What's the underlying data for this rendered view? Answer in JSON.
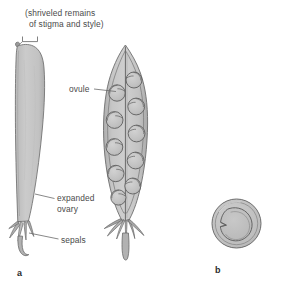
{
  "figure": {
    "background_color": "#ffffff",
    "ink_color": "#5a5a5a",
    "fill_light": "#c9c9c9",
    "fill_mid": "#b4b4b4",
    "fill_dark": "#a0a0a0",
    "label_color": "#4a4a4a"
  },
  "labels": {
    "stigma_style": "(shriveled remains\nof stigma and style)",
    "stigma_style_line1": "(shriveled remains",
    "stigma_style_line2": "of stigma and style)",
    "ovule": "ovule",
    "expanded_ovary_line1": "expanded",
    "expanded_ovary_line2": "ovary",
    "sepals": "sepals"
  },
  "captions": {
    "a": "a",
    "b": "b"
  },
  "parts": {
    "intact_pod": {
      "name": "intact pod",
      "caption": "a",
      "has_stigma_remnant": true,
      "has_sepals": true,
      "has_stalk": true
    },
    "sectioned_pod": {
      "name": "longitudinally sectioned pod",
      "caption": "a",
      "ovule_count": 10,
      "ovules_left": 5,
      "ovules_right": 5,
      "has_septum": true,
      "has_sepals": true,
      "has_stalk": true
    },
    "cross_section": {
      "name": "cross section of pod",
      "caption": "b",
      "outer_wall": true,
      "inner_seed": true,
      "notch": "left"
    }
  }
}
